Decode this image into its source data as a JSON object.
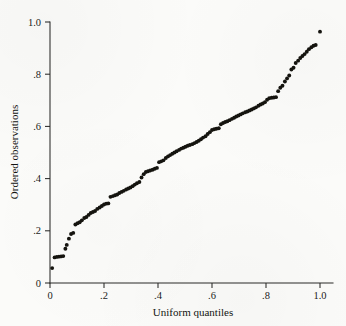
{
  "figure": {
    "background_color": "#fbfbf9",
    "ink_color": "#15140f"
  },
  "chart_data": {
    "type": "scatter",
    "title": "",
    "subtitle": "",
    "xlabel": "Uniform quantiles",
    "ylabel": "Ordered observations",
    "xlim": [
      0,
      1.05
    ],
    "ylim": [
      0,
      1.04
    ],
    "grid": false,
    "legend": null,
    "x_ticks": [
      0,
      0.2,
      0.4,
      0.6,
      0.8,
      1.0
    ],
    "x_tick_labels": [
      "0",
      ".2",
      ".4",
      ".6",
      ".8",
      "1.0"
    ],
    "y_ticks": [
      0,
      0.2,
      0.4,
      0.6,
      0.8,
      1.0
    ],
    "y_tick_labels": [
      "0",
      ".2",
      ".4",
      ".6",
      ".8",
      "1.0"
    ],
    "marker": "filled-circle",
    "marker_color": "#15140f",
    "marker_size_px": 2.4,
    "series": [
      {
        "name": "ordered observations vs uniform quantiles",
        "points": [
          [
            0.008,
            0.057
          ],
          [
            0.017,
            0.098
          ],
          [
            0.025,
            0.1
          ],
          [
            0.033,
            0.101
          ],
          [
            0.041,
            0.102
          ],
          [
            0.049,
            0.103
          ],
          [
            0.057,
            0.131
          ],
          [
            0.062,
            0.146
          ],
          [
            0.07,
            0.17
          ],
          [
            0.078,
            0.188
          ],
          [
            0.086,
            0.192
          ],
          [
            0.094,
            0.224
          ],
          [
            0.102,
            0.229
          ],
          [
            0.11,
            0.233
          ],
          [
            0.118,
            0.24
          ],
          [
            0.127,
            0.249
          ],
          [
            0.135,
            0.253
          ],
          [
            0.143,
            0.261
          ],
          [
            0.151,
            0.268
          ],
          [
            0.159,
            0.272
          ],
          [
            0.167,
            0.276
          ],
          [
            0.175,
            0.284
          ],
          [
            0.184,
            0.289
          ],
          [
            0.192,
            0.295
          ],
          [
            0.2,
            0.301
          ],
          [
            0.208,
            0.304
          ],
          [
            0.216,
            0.305
          ],
          [
            0.224,
            0.33
          ],
          [
            0.233,
            0.333
          ],
          [
            0.241,
            0.336
          ],
          [
            0.249,
            0.339
          ],
          [
            0.257,
            0.345
          ],
          [
            0.265,
            0.349
          ],
          [
            0.273,
            0.353
          ],
          [
            0.282,
            0.358
          ],
          [
            0.29,
            0.362
          ],
          [
            0.298,
            0.366
          ],
          [
            0.306,
            0.371
          ],
          [
            0.314,
            0.377
          ],
          [
            0.322,
            0.382
          ],
          [
            0.331,
            0.387
          ],
          [
            0.339,
            0.404
          ],
          [
            0.347,
            0.417
          ],
          [
            0.355,
            0.425
          ],
          [
            0.363,
            0.428
          ],
          [
            0.371,
            0.431
          ],
          [
            0.38,
            0.434
          ],
          [
            0.388,
            0.438
          ],
          [
            0.396,
            0.441
          ],
          [
            0.404,
            0.463
          ],
          [
            0.412,
            0.466
          ],
          [
            0.42,
            0.47
          ],
          [
            0.429,
            0.479
          ],
          [
            0.437,
            0.485
          ],
          [
            0.445,
            0.49
          ],
          [
            0.453,
            0.495
          ],
          [
            0.461,
            0.5
          ],
          [
            0.469,
            0.505
          ],
          [
            0.478,
            0.51
          ],
          [
            0.486,
            0.515
          ],
          [
            0.494,
            0.518
          ],
          [
            0.502,
            0.522
          ],
          [
            0.51,
            0.526
          ],
          [
            0.518,
            0.529
          ],
          [
            0.527,
            0.532
          ],
          [
            0.535,
            0.536
          ],
          [
            0.543,
            0.54
          ],
          [
            0.551,
            0.545
          ],
          [
            0.559,
            0.551
          ],
          [
            0.567,
            0.557
          ],
          [
            0.576,
            0.562
          ],
          [
            0.584,
            0.571
          ],
          [
            0.592,
            0.578
          ],
          [
            0.6,
            0.586
          ],
          [
            0.608,
            0.589
          ],
          [
            0.616,
            0.591
          ],
          [
            0.625,
            0.593
          ],
          [
            0.633,
            0.608
          ],
          [
            0.641,
            0.613
          ],
          [
            0.649,
            0.617
          ],
          [
            0.657,
            0.62
          ],
          [
            0.665,
            0.624
          ],
          [
            0.674,
            0.629
          ],
          [
            0.682,
            0.633
          ],
          [
            0.69,
            0.638
          ],
          [
            0.698,
            0.642
          ],
          [
            0.706,
            0.646
          ],
          [
            0.714,
            0.65
          ],
          [
            0.723,
            0.654
          ],
          [
            0.731,
            0.657
          ],
          [
            0.739,
            0.661
          ],
          [
            0.747,
            0.665
          ],
          [
            0.755,
            0.669
          ],
          [
            0.763,
            0.673
          ],
          [
            0.772,
            0.679
          ],
          [
            0.78,
            0.684
          ],
          [
            0.788,
            0.688
          ],
          [
            0.796,
            0.693
          ],
          [
            0.804,
            0.702
          ],
          [
            0.812,
            0.708
          ],
          [
            0.821,
            0.71
          ],
          [
            0.829,
            0.711
          ],
          [
            0.837,
            0.712
          ],
          [
            0.845,
            0.735
          ],
          [
            0.853,
            0.748
          ],
          [
            0.861,
            0.756
          ],
          [
            0.87,
            0.772
          ],
          [
            0.878,
            0.784
          ],
          [
            0.886,
            0.795
          ],
          [
            0.894,
            0.818
          ],
          [
            0.902,
            0.825
          ],
          [
            0.91,
            0.843
          ],
          [
            0.919,
            0.852
          ],
          [
            0.927,
            0.862
          ],
          [
            0.935,
            0.87
          ],
          [
            0.943,
            0.877
          ],
          [
            0.951,
            0.886
          ],
          [
            0.959,
            0.896
          ],
          [
            0.968,
            0.903
          ],
          [
            0.976,
            0.909
          ],
          [
            0.984,
            0.912
          ],
          [
            1.0,
            0.963
          ]
        ]
      }
    ]
  }
}
